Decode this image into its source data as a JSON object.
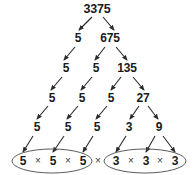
{
  "diagram": {
    "type": "factor-tree",
    "title_text": "",
    "background_color": "#ffffff",
    "stroke_color": "#2b2b2b",
    "text_color": "#1a1a1a",
    "root_value": "3375",
    "levels": [
      {
        "level": 0,
        "nodes": [
          {
            "id": "n3375",
            "label": "3375",
            "x": 97,
            "y": 9,
            "kind": "composite"
          }
        ]
      },
      {
        "level": 1,
        "nodes": [
          {
            "id": "n5a",
            "label": "5",
            "x": 78,
            "y": 38,
            "kind": "prime"
          },
          {
            "id": "n675",
            "label": "675",
            "x": 110,
            "y": 38,
            "kind": "composite"
          }
        ]
      },
      {
        "level": 2,
        "nodes": [
          {
            "id": "n5b",
            "label": "5",
            "x": 66,
            "y": 68,
            "kind": "prime"
          },
          {
            "id": "n5c",
            "label": "5",
            "x": 96,
            "y": 68,
            "kind": "prime"
          },
          {
            "id": "n135",
            "label": "135",
            "x": 127,
            "y": 68,
            "kind": "composite"
          }
        ]
      },
      {
        "level": 3,
        "nodes": [
          {
            "id": "n5d",
            "label": "5",
            "x": 52,
            "y": 98,
            "kind": "prime"
          },
          {
            "id": "n5e",
            "label": "5",
            "x": 82,
            "y": 98,
            "kind": "prime"
          },
          {
            "id": "n5f",
            "label": "5",
            "x": 111,
            "y": 98,
            "kind": "prime"
          },
          {
            "id": "n27",
            "label": "27",
            "x": 143,
            "y": 98,
            "kind": "composite"
          }
        ]
      },
      {
        "level": 4,
        "nodes": [
          {
            "id": "n5g",
            "label": "5",
            "x": 37,
            "y": 127,
            "kind": "prime"
          },
          {
            "id": "n5h",
            "label": "5",
            "x": 68,
            "y": 127,
            "kind": "prime"
          },
          {
            "id": "n5i",
            "label": "5",
            "x": 97,
            "y": 127,
            "kind": "prime"
          },
          {
            "id": "n3a",
            "label": "3",
            "x": 129,
            "y": 127,
            "kind": "prime"
          },
          {
            "id": "n9",
            "label": "9",
            "x": 159,
            "y": 127,
            "kind": "composite"
          }
        ]
      }
    ],
    "edges": [
      {
        "from": "n3375",
        "to": "n5a",
        "x1": 92,
        "y1": 17,
        "x2": 79,
        "y2": 30
      },
      {
        "from": "n3375",
        "to": "n675",
        "x1": 103,
        "y1": 17,
        "x2": 114,
        "y2": 30
      },
      {
        "from": "n5a",
        "to": "n5b",
        "x1": 75,
        "y1": 47,
        "x2": 64,
        "y2": 60
      },
      {
        "from": "n675",
        "to": "n5c",
        "x1": 105,
        "y1": 47,
        "x2": 95,
        "y2": 60
      },
      {
        "from": "n675",
        "to": "n135",
        "x1": 116,
        "y1": 47,
        "x2": 127,
        "y2": 60
      },
      {
        "from": "n5b",
        "to": "n5d",
        "x1": 62,
        "y1": 77,
        "x2": 51,
        "y2": 90
      },
      {
        "from": "n5c",
        "to": "n5e",
        "x1": 92,
        "y1": 77,
        "x2": 81,
        "y2": 90
      },
      {
        "from": "n135",
        "to": "n5f",
        "x1": 121,
        "y1": 77,
        "x2": 111,
        "y2": 90
      },
      {
        "from": "n135",
        "to": "n27",
        "x1": 133,
        "y1": 77,
        "x2": 144,
        "y2": 90
      },
      {
        "from": "n5d",
        "to": "n5g",
        "x1": 48,
        "y1": 106,
        "x2": 37,
        "y2": 119
      },
      {
        "from": "n5e",
        "to": "n5h",
        "x1": 78,
        "y1": 106,
        "x2": 67,
        "y2": 119
      },
      {
        "from": "n5f",
        "to": "n5i",
        "x1": 107,
        "y1": 106,
        "x2": 96,
        "y2": 119
      },
      {
        "from": "n27",
        "to": "n3a",
        "x1": 139,
        "y1": 106,
        "x2": 130,
        "y2": 119
      },
      {
        "from": "n27",
        "to": "n9",
        "x1": 148,
        "y1": 106,
        "x2": 158,
        "y2": 119
      },
      {
        "from": "n5g",
        "to": "L1",
        "x1": 33,
        "y1": 136,
        "x2": 23,
        "y2": 152
      },
      {
        "from": "n5h",
        "to": "L2",
        "x1": 64,
        "y1": 136,
        "x2": 53,
        "y2": 152
      },
      {
        "from": "n5i",
        "to": "L3",
        "x1": 93,
        "y1": 136,
        "x2": 83,
        "y2": 152
      },
      {
        "from": "n3a",
        "to": "L4",
        "x1": 126,
        "y1": 136,
        "x2": 116,
        "y2": 152
      },
      {
        "from": "n9",
        "to": "L5",
        "x1": 155,
        "y1": 136,
        "x2": 146,
        "y2": 152
      },
      {
        "from": "n9",
        "to": "L6",
        "x1": 163,
        "y1": 136,
        "x2": 175,
        "y2": 152
      }
    ],
    "bottom_row": {
      "group_left": {
        "id": "group-fives",
        "ellipse": {
          "cx": 52,
          "cy": 161,
          "rx": 40,
          "ry": 12
        },
        "factors": [
          {
            "id": "L1",
            "label": "5",
            "x": 23,
            "y": 161
          },
          {
            "id": "L2",
            "label": "5",
            "x": 53,
            "y": 161
          },
          {
            "id": "L3",
            "label": "5",
            "x": 83,
            "y": 161
          }
        ],
        "operators": [
          {
            "label": "×",
            "x": 38,
            "y": 161
          },
          {
            "label": "×",
            "x": 68,
            "y": 161
          }
        ]
      },
      "middle_operator": {
        "label": "×",
        "x": 98,
        "y": 161
      },
      "group_right": {
        "id": "group-threes",
        "ellipse": {
          "cx": 145,
          "cy": 161,
          "rx": 41,
          "ry": 12
        },
        "factors": [
          {
            "id": "L4",
            "label": "3",
            "x": 116,
            "y": 161
          },
          {
            "id": "L5",
            "label": "3",
            "x": 146,
            "y": 161
          },
          {
            "id": "L6",
            "label": "3",
            "x": 175,
            "y": 161
          }
        ],
        "operators": [
          {
            "label": "×",
            "x": 131,
            "y": 161
          },
          {
            "label": "×",
            "x": 160,
            "y": 161
          }
        ]
      }
    }
  }
}
